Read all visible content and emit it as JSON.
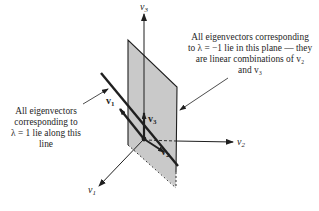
{
  "figure": {
    "axes": {
      "v1_label": "v",
      "v1_sub": "1",
      "v2_label": "v",
      "v2_sub": "2",
      "v3_label": "v",
      "v3_sub": "3"
    },
    "vectors": {
      "v1_label": "v",
      "v1_sub": "1",
      "v2_label": "v",
      "v2_sub": "2",
      "v3_label": "v",
      "v3_sub": "3"
    },
    "annotations": {
      "plane_caption_lines": [
        "All eigenvectors corresponding",
        "to λ = −1 lie in this plane — they",
        "are linear combinations of v₂",
        "and v₃"
      ],
      "line_caption_lines": [
        "All eigenvectors",
        "corresponding to",
        "λ = 1 lie along this",
        "line"
      ]
    },
    "colors": {
      "plane_fill": "#c9c9c9",
      "ink": "#1f1f1f",
      "background": "#ffffff"
    }
  }
}
